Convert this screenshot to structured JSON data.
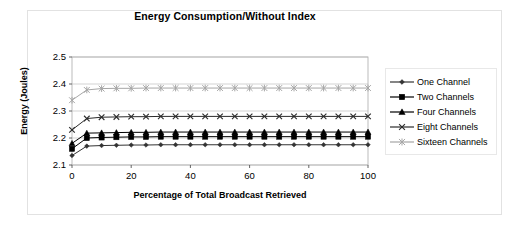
{
  "chart_data": {
    "type": "line",
    "title": "Energy Consumption/Without Index",
    "xlabel": "Percentage of Total Broadcast Retrieved",
    "ylabel": "Energy (Joules)",
    "xlim": [
      0,
      100
    ],
    "ylim": [
      2.1,
      2.5
    ],
    "xticks": [
      0,
      20,
      40,
      60,
      80,
      100
    ],
    "yticks": [
      2.1,
      2.2,
      2.3,
      2.4,
      2.5
    ],
    "grid": "horizontal",
    "legend_position": "right",
    "x": [
      0,
      5,
      10,
      15,
      20,
      25,
      30,
      35,
      40,
      45,
      50,
      55,
      60,
      65,
      70,
      75,
      80,
      85,
      90,
      95,
      100
    ],
    "series": [
      {
        "name": "One Channel",
        "marker": "diamond",
        "color": "#333333",
        "values": [
          2.135,
          2.17,
          2.172,
          2.173,
          2.174,
          2.174,
          2.175,
          2.175,
          2.175,
          2.175,
          2.175,
          2.175,
          2.175,
          2.175,
          2.175,
          2.175,
          2.175,
          2.175,
          2.175,
          2.175,
          2.175
        ]
      },
      {
        "name": "Two Channels",
        "marker": "square",
        "color": "#000000",
        "values": [
          2.16,
          2.2,
          2.202,
          2.203,
          2.204,
          2.204,
          2.205,
          2.205,
          2.205,
          2.205,
          2.205,
          2.205,
          2.205,
          2.205,
          2.205,
          2.205,
          2.205,
          2.205,
          2.205,
          2.205,
          2.205
        ]
      },
      {
        "name": "Four Channels",
        "marker": "triangle",
        "color": "#000000",
        "values": [
          2.18,
          2.218,
          2.219,
          2.22,
          2.221,
          2.221,
          2.222,
          2.222,
          2.222,
          2.222,
          2.222,
          2.222,
          2.222,
          2.222,
          2.222,
          2.222,
          2.222,
          2.222,
          2.222,
          2.222,
          2.222
        ]
      },
      {
        "name": "Eight Channels",
        "marker": "cross",
        "color": "#2b2b2b",
        "values": [
          2.23,
          2.272,
          2.277,
          2.278,
          2.279,
          2.279,
          2.28,
          2.28,
          2.28,
          2.28,
          2.28,
          2.28,
          2.28,
          2.28,
          2.28,
          2.28,
          2.28,
          2.28,
          2.28,
          2.28,
          2.28
        ]
      },
      {
        "name": "Sixteen Channels",
        "marker": "asterisk",
        "color": "#a6a6a6",
        "values": [
          2.34,
          2.378,
          2.383,
          2.384,
          2.384,
          2.385,
          2.385,
          2.385,
          2.385,
          2.385,
          2.385,
          2.385,
          2.385,
          2.385,
          2.385,
          2.385,
          2.385,
          2.385,
          2.385,
          2.385,
          2.385
        ]
      }
    ]
  }
}
